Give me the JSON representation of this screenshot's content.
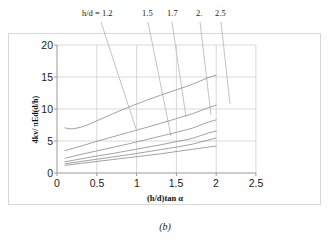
{
  "caption": "(b)",
  "axis": {
    "ylabel": "4kv/ πEd(d/h)",
    "xlabel": "(h/d)tan α",
    "xticks": [
      "0",
      "0.5",
      "1",
      "1.5",
      "2",
      "2.5"
    ],
    "yticks": [
      "0",
      "5",
      "10",
      "15",
      "20"
    ]
  },
  "annotations": {
    "prefix": "h/d = ",
    "labels": [
      "1.2",
      "1.5",
      "1.7",
      "2.",
      "2.5"
    ]
  },
  "colors": {
    "curve": "#8a8a8a",
    "grid": "#c9c9c9",
    "axis": "#9a9a9a",
    "frame": "#d8d8d8",
    "leader": "#a8a8a8",
    "text": "#1a1a1a"
  },
  "chart_data": {
    "type": "line",
    "title": "",
    "xlabel": "(h/d)tan α",
    "ylabel": "4kv/ πEd(d/h)",
    "xlim": [
      0,
      2.5
    ],
    "ylim": [
      0,
      20
    ],
    "xticks": [
      0,
      0.5,
      1,
      1.5,
      2,
      2.5
    ],
    "yticks": [
      0,
      5,
      10,
      15,
      20
    ],
    "grid": true,
    "legend": "annotated-leader-lines-above-plot",
    "series": [
      {
        "name": "h/d = 1.2",
        "label_position": "top",
        "x": [
          0.1,
          0.15,
          0.2,
          0.3,
          0.4,
          0.5,
          0.7,
          0.9,
          1.1,
          1.3,
          1.5,
          1.7,
          1.9,
          2.0
        ],
        "y": [
          7.05,
          6.92,
          6.9,
          7.15,
          7.6,
          8.15,
          9.25,
          10.3,
          11.25,
          12.15,
          13.0,
          13.85,
          14.9,
          15.3
        ]
      },
      {
        "name": "h/d = 1.5",
        "label_position": "top",
        "x": [
          0.1,
          0.3,
          0.5,
          0.7,
          0.9,
          1.1,
          1.3,
          1.5,
          1.7,
          1.9,
          2.0
        ],
        "y": [
          3.5,
          4.2,
          4.95,
          5.65,
          6.35,
          7.05,
          7.75,
          8.5,
          9.25,
          10.2,
          10.6
        ]
      },
      {
        "name": "h/d = 1.7",
        "label_position": "top",
        "x": [
          0.1,
          0.3,
          0.5,
          0.7,
          0.9,
          1.1,
          1.3,
          1.5,
          1.7,
          1.9,
          2.0
        ],
        "y": [
          2.3,
          2.9,
          3.45,
          4.0,
          4.55,
          5.15,
          5.75,
          6.35,
          7.0,
          7.95,
          8.3
        ]
      },
      {
        "name": "h/d = 2.",
        "label_position": "top",
        "x": [
          0.1,
          0.3,
          0.5,
          0.7,
          0.9,
          1.1,
          1.3,
          1.5,
          1.7,
          1.9,
          2.0
        ],
        "y": [
          1.75,
          2.2,
          2.65,
          3.05,
          3.5,
          3.95,
          4.4,
          4.9,
          5.4,
          6.25,
          6.55
        ]
      },
      {
        "name": "h/d = 2.5",
        "label_position": "top",
        "x": [
          0.1,
          0.3,
          0.5,
          0.7,
          0.9,
          1.1,
          1.3,
          1.5,
          1.7,
          1.9,
          2.0
        ],
        "y": [
          1.45,
          1.8,
          2.15,
          2.5,
          2.85,
          3.25,
          3.65,
          4.05,
          4.5,
          5.15,
          5.45
        ]
      },
      {
        "name": "lower-curve-6",
        "label_position": "none",
        "x": [
          0.1,
          0.3,
          0.5,
          0.7,
          0.9,
          1.1,
          1.3,
          1.5,
          1.7,
          1.9,
          2.0
        ],
        "y": [
          1.2,
          1.5,
          1.8,
          2.1,
          2.4,
          2.7,
          3.0,
          3.35,
          3.7,
          4.05,
          4.2
        ]
      }
    ]
  }
}
